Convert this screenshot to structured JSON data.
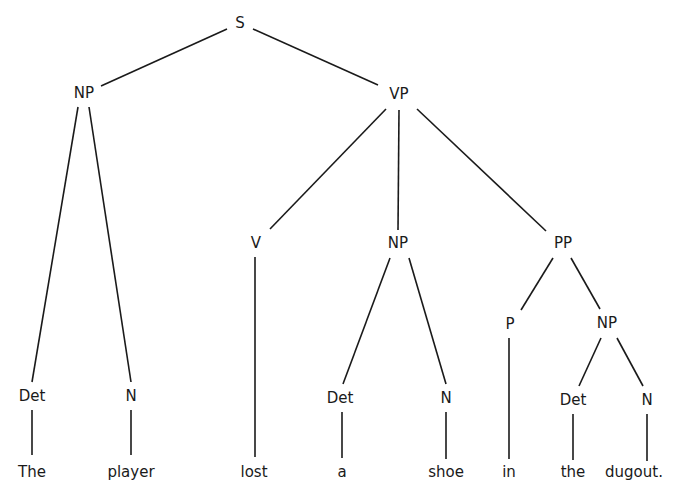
{
  "diagram": {
    "type": "parse-tree",
    "sentence": "The player lost a shoe in the dugout.",
    "colors": {
      "line": "#1a1a1a",
      "text": "#1a1a1a",
      "background": "#ffffff"
    },
    "nodes": [
      {
        "id": "s",
        "label": "S",
        "x": 240,
        "y": 23
      },
      {
        "id": "np1",
        "label": "NP",
        "x": 84,
        "y": 93
      },
      {
        "id": "vp",
        "label": "VP",
        "x": 399,
        "y": 94
      },
      {
        "id": "det1",
        "label": "Det",
        "x": 32,
        "y": 396
      },
      {
        "id": "n1",
        "label": "N",
        "x": 131,
        "y": 396
      },
      {
        "id": "v",
        "label": "V",
        "x": 256,
        "y": 243
      },
      {
        "id": "np2",
        "label": "NP",
        "x": 398,
        "y": 243
      },
      {
        "id": "pp",
        "label": "PP",
        "x": 563,
        "y": 243
      },
      {
        "id": "det2",
        "label": "Det",
        "x": 340,
        "y": 398
      },
      {
        "id": "n2",
        "label": "N",
        "x": 446,
        "y": 398
      },
      {
        "id": "p",
        "label": "P",
        "x": 510,
        "y": 324
      },
      {
        "id": "np3",
        "label": "NP",
        "x": 607,
        "y": 323
      },
      {
        "id": "det3",
        "label": "Det",
        "x": 573,
        "y": 400
      },
      {
        "id": "n3",
        "label": "N",
        "x": 647,
        "y": 400
      }
    ],
    "words": [
      {
        "label": "The",
        "x": 32,
        "y": 472
      },
      {
        "label": "player",
        "x": 131,
        "y": 472
      },
      {
        "label": "lost",
        "x": 254,
        "y": 472
      },
      {
        "label": "a",
        "x": 342,
        "y": 472
      },
      {
        "label": "shoe",
        "x": 446,
        "y": 472
      },
      {
        "label": "in",
        "x": 509,
        "y": 472
      },
      {
        "label": "the",
        "x": 573,
        "y": 472
      },
      {
        "label": "dugout.",
        "x": 634,
        "y": 472
      }
    ],
    "edges": [
      {
        "from": "s",
        "to": "np1",
        "x1": 227,
        "y1": 29,
        "x2": 101,
        "y2": 86
      },
      {
        "from": "s",
        "to": "vp",
        "x1": 253,
        "y1": 29,
        "x2": 378,
        "y2": 85
      },
      {
        "from": "np1",
        "to": "det1",
        "x1": 78,
        "y1": 107,
        "x2": 32,
        "y2": 382
      },
      {
        "from": "np1",
        "to": "n1",
        "x1": 89,
        "y1": 107,
        "x2": 131,
        "y2": 382
      },
      {
        "from": "vp",
        "to": "v",
        "x1": 386,
        "y1": 109,
        "x2": 270,
        "y2": 229
      },
      {
        "from": "vp",
        "to": "np2",
        "x1": 399,
        "y1": 110,
        "x2": 398,
        "y2": 230
      },
      {
        "from": "vp",
        "to": "pp",
        "x1": 417,
        "y1": 109,
        "x2": 546,
        "y2": 231
      },
      {
        "from": "np2",
        "to": "det2",
        "x1": 390,
        "y1": 258,
        "x2": 343,
        "y2": 384
      },
      {
        "from": "np2",
        "to": "n2",
        "x1": 409,
        "y1": 258,
        "x2": 446,
        "y2": 384
      },
      {
        "from": "pp",
        "to": "p",
        "x1": 553,
        "y1": 258,
        "x2": 521,
        "y2": 310
      },
      {
        "from": "pp",
        "to": "np3",
        "x1": 571,
        "y1": 258,
        "x2": 600,
        "y2": 309
      },
      {
        "from": "np3",
        "to": "det3",
        "x1": 601,
        "y1": 338,
        "x2": 579,
        "y2": 386
      },
      {
        "from": "np3",
        "to": "n3",
        "x1": 617,
        "y1": 338,
        "x2": 643,
        "y2": 386
      },
      {
        "from": "det1",
        "to": "w0",
        "x1": 32,
        "y1": 410,
        "x2": 32,
        "y2": 455
      },
      {
        "from": "n1",
        "to": "w1",
        "x1": 131,
        "y1": 410,
        "x2": 131,
        "y2": 455
      },
      {
        "from": "v",
        "to": "w2",
        "x1": 255,
        "y1": 257,
        "x2": 255,
        "y2": 457
      },
      {
        "from": "det2",
        "to": "w3",
        "x1": 342,
        "y1": 412,
        "x2": 342,
        "y2": 458
      },
      {
        "from": "n2",
        "to": "w4",
        "x1": 446,
        "y1": 412,
        "x2": 446,
        "y2": 459
      },
      {
        "from": "p",
        "to": "w5",
        "x1": 509,
        "y1": 338,
        "x2": 509,
        "y2": 459
      },
      {
        "from": "det3",
        "to": "w6",
        "x1": 573,
        "y1": 414,
        "x2": 573,
        "y2": 460
      },
      {
        "from": "n3",
        "to": "w7",
        "x1": 647,
        "y1": 414,
        "x2": 647,
        "y2": 461
      }
    ]
  }
}
